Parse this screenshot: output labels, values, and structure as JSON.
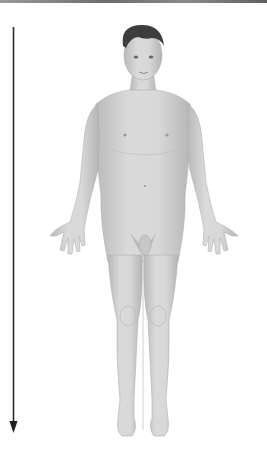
{
  "diagram": {
    "subject": "Human figure in anatomical position (anterior view)",
    "arrow": {
      "direction": "down",
      "meaning": "superior-to-inferior axis",
      "color": "#2b2b2b"
    },
    "figure": {
      "skin_color": "#d4d4d4",
      "shadow_color": "#a9a9a9",
      "hair_color": "#3d3d3d"
    },
    "top_bar_color": "#777777"
  }
}
